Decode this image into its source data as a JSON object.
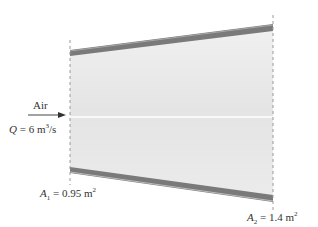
{
  "diagram": {
    "type": "diverging duct",
    "inlet_label": "Air",
    "flow": {
      "symbol": "Q",
      "equals": "=",
      "value": "6",
      "unit": "m",
      "unit_exp": "3",
      "unit_tail": "/s"
    },
    "inlet_area": {
      "symbol": "A",
      "subscript": "1",
      "equals": "=",
      "value": "0.95",
      "unit": "m",
      "unit_exp": "2"
    },
    "outlet_area": {
      "symbol": "A",
      "subscript": "2",
      "equals": "=",
      "value": "1.4",
      "unit": "m",
      "unit_exp": "2"
    },
    "colors": {
      "wall": "#7a7a7a",
      "wall_highlight": "#bdbdbd",
      "fluid": "#e6e6e6",
      "centerline": "#ffffff",
      "section_line": "#9a9a9a",
      "text": "#333333"
    }
  }
}
